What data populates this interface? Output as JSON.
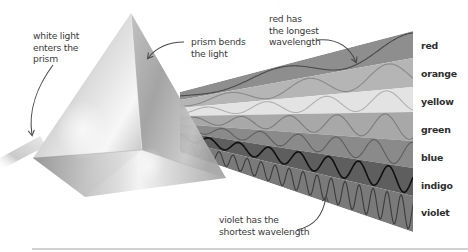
{
  "diagram": {
    "annotations": {
      "white_light": [
        "white light",
        "enters the",
        "prism"
      ],
      "prism_bends": [
        "prism bends",
        "the light"
      ],
      "red_longest": [
        "red has",
        "the longest",
        "wavelength"
      ],
      "violet_shortest": [
        "violet has the",
        "shortest wavelength"
      ]
    },
    "bands": [
      {
        "label": "red",
        "fill": "#8e8e8e",
        "wave": "#4a4a4a",
        "wavelength_px": 130
      },
      {
        "label": "orange",
        "fill": "#b5b5b5",
        "wave": "#8a8a8a",
        "wavelength_px": 80
      },
      {
        "label": "yellow",
        "fill": "#e3e3e3",
        "wave": "#b0b0b0",
        "wavelength_px": 60
      },
      {
        "label": "green",
        "fill": "#a8a8a8",
        "wave": "#7c7c7c",
        "wavelength_px": 48
      },
      {
        "label": "blue",
        "fill": "#8a8a8a",
        "wave": "#5e5e5e",
        "wavelength_px": 38
      },
      {
        "label": "indigo",
        "fill": "#5e5e5e",
        "wave": "#111111",
        "wavelength_px": 30
      },
      {
        "label": "violet",
        "fill": "#7a7a7a",
        "wave": "#3c3c3c",
        "wavelength_px": 14
      }
    ],
    "colors": {
      "background": "#ffffff",
      "annotation_text": "#3a3a3a",
      "arrow": "#4a4a4a",
      "divider": "#d2d2d2"
    }
  }
}
